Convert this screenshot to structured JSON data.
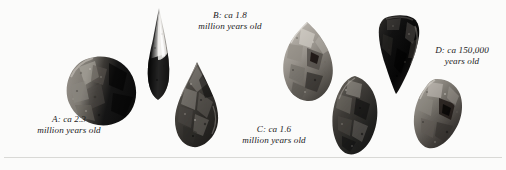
{
  "figure": {
    "background_color": "#fbfbfa",
    "ink_color": "#1a1a1a",
    "rule_color": "#d9d9d6"
  },
  "captions": [
    {
      "key": "A",
      "text": "A: ca 2.3\nmillion years old",
      "line1": "A: ca 2.3",
      "line2": "million years old",
      "x": 17,
      "y": 114,
      "width": 104
    },
    {
      "key": "B",
      "text": "B: ca 1.8\nmillion years old",
      "line1": "B: ca 1.8",
      "line2": "million years old",
      "x": 178,
      "y": 10,
      "width": 104
    },
    {
      "key": "C",
      "text": "C: ca 1.6\nmillion years old",
      "line1": "C: ca 1.6",
      "line2": "million years old",
      "x": 222,
      "y": 124,
      "width": 104
    },
    {
      "key": "D",
      "text": "D: ca 150,000\nyears old",
      "line1": "D: ca 150,000",
      "line2": "years old",
      "x": 420,
      "y": 45,
      "width": 84
    }
  ],
  "artifacts": [
    {
      "id": "artifact-a-chopper",
      "label": "A",
      "description": "rounded chopper core, light grey left face, very dark right face",
      "x": 65,
      "y": 55,
      "width": 74,
      "height": 72,
      "tone_light": "#9a958e",
      "tone_mid": "#5d5953",
      "tone_dark": "#141414"
    },
    {
      "id": "artifact-b-point",
      "label": "B",
      "description": "tall narrow pointed flake, near-black with white highlight streak",
      "x": 142,
      "y": 8,
      "width": 34,
      "height": 92,
      "tone_light": "#efefed",
      "tone_mid": "#6a6762",
      "tone_dark": "#0d0d0d"
    },
    {
      "id": "artifact-c-handaxe",
      "label": "C",
      "description": "teardrop handaxe, pointed tip, mottled dark grey",
      "x": 173,
      "y": 62,
      "width": 48,
      "height": 86,
      "tone_light": "#b3aea6",
      "tone_mid": "#57534d",
      "tone_dark": "#1b1b1b"
    },
    {
      "id": "artifact-c-cleaver",
      "label": "C",
      "description": "angular light grey triangular core with deep flake scars",
      "x": 281,
      "y": 22,
      "width": 54,
      "height": 80,
      "tone_light": "#c2bdb5",
      "tone_mid": "#6e6a64",
      "tone_dark": "#232323"
    },
    {
      "id": "artifact-c-ovate",
      "label": "C",
      "description": "oval dark mottled handaxe",
      "x": 332,
      "y": 76,
      "width": 46,
      "height": 80,
      "tone_light": "#a6a199",
      "tone_mid": "#4e4a45",
      "tone_dark": "#141414"
    },
    {
      "id": "artifact-d-levallois-point",
      "label": "D",
      "description": "inverted triangular Levallois point, near-black",
      "x": 377,
      "y": 14,
      "width": 44,
      "height": 80,
      "tone_light": "#8d8881",
      "tone_mid": "#3a3733",
      "tone_dark": "#080808"
    },
    {
      "id": "artifact-d-scraper",
      "label": "D",
      "description": "rounded mottled scraper, grey with dark hollows",
      "x": 413,
      "y": 78,
      "width": 50,
      "height": 74,
      "tone_light": "#b0aba3",
      "tone_mid": "#57534e",
      "tone_dark": "#171717"
    }
  ]
}
